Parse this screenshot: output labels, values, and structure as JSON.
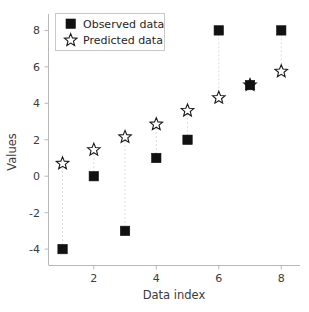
{
  "chart_data": {
    "type": "scatter",
    "title": "",
    "xlabel": "Data index",
    "ylabel": "Values",
    "x": [
      1,
      2,
      3,
      4,
      5,
      6,
      7,
      8
    ],
    "series": [
      {
        "name": "Observed data",
        "marker": "filled-square",
        "color": "#111111",
        "values": [
          -4,
          0,
          -3,
          1,
          2,
          8,
          5,
          8
        ]
      },
      {
        "name": "Predicted data",
        "marker": "open-star",
        "color": "#1a1a1a",
        "values": [
          0.7,
          1.45,
          2.15,
          2.85,
          3.6,
          4.3,
          5.0,
          5.75
        ]
      }
    ],
    "xlim": [
      0.55,
      8.6
    ],
    "ylim": [
      -4.9,
      8.9
    ],
    "xticks": [
      2,
      4,
      6,
      8
    ],
    "xtick_labels": [
      "2",
      "4",
      "6",
      "8"
    ],
    "yticks": [
      -4,
      -2,
      0,
      2,
      4,
      6,
      8
    ],
    "ytick_labels": [
      "-4",
      "-2",
      "0",
      "2",
      "4",
      "6",
      "8"
    ],
    "grid": false,
    "legend_position": "upper-left",
    "connector_lines": true,
    "connector_color": "#dcdcdc"
  },
  "legend": {
    "entries": [
      {
        "label": "Observed data",
        "marker_name": "filled-square-marker"
      },
      {
        "label": "Predicted data",
        "marker_name": "open-star-marker"
      }
    ]
  },
  "axes": {
    "x_title": "Data index",
    "y_title": "Values",
    "spine_color": "#b8b8b8",
    "tick_color": "#3b3b3b"
  }
}
